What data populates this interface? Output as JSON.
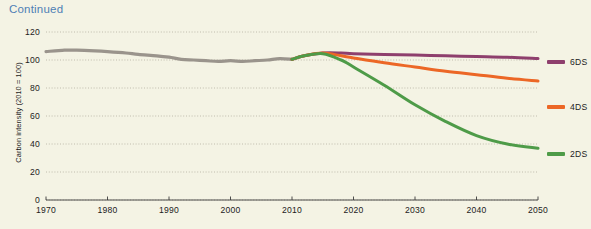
{
  "chart_title": "Continued",
  "title_color": "#4f7fb5",
  "background_color": "#f4f3e4",
  "legend": {
    "position": "right",
    "entries": [
      {
        "label": "6DS",
        "color": "#8e3f6d"
      },
      {
        "label": "4DS",
        "color": "#ec6726"
      },
      {
        "label": "2DS",
        "color": "#4e9b48"
      }
    ]
  },
  "chart_data": {
    "type": "line",
    "title": "Continued",
    "xlabel": "",
    "ylabel": "Carbon intensity (2010 = 100)",
    "xlim": [
      1970,
      2050
    ],
    "ylim": [
      0,
      120
    ],
    "xticks": [
      1970,
      1980,
      1990,
      2000,
      2010,
      2020,
      2030,
      2040,
      2050
    ],
    "yticks": [
      0,
      20,
      40,
      60,
      80,
      100,
      120
    ],
    "xtick_labels": [
      "1970",
      "1980",
      "1990",
      "2000",
      "2010",
      "2020",
      "2030",
      "2040",
      "2050"
    ],
    "ytick_labels": [
      "0",
      "20",
      "40",
      "60",
      "80",
      "100",
      "120"
    ],
    "grid": "horizontal-dotted",
    "series": [
      {
        "name": "Historical",
        "color": "#9a948c",
        "x": [
          1970,
          1973,
          1975,
          1978,
          1980,
          1983,
          1985,
          1988,
          1990,
          1992,
          1994,
          1996,
          1998,
          2000,
          2002,
          2004,
          2006,
          2008,
          2010
        ],
        "values": [
          106,
          107,
          107,
          106.5,
          106,
          105,
          104,
          103,
          102,
          100.5,
          100,
          99.5,
          99,
          99.5,
          99,
          99.5,
          100,
          101,
          100.5
        ]
      },
      {
        "name": "6DS",
        "color": "#8e3f6d",
        "x": [
          2010,
          2012,
          2015,
          2018,
          2020,
          2025,
          2030,
          2035,
          2040,
          2045,
          2050
        ],
        "values": [
          100.5,
          103,
          105,
          105,
          104.5,
          104,
          103.5,
          103,
          102.5,
          102,
          101
        ]
      },
      {
        "name": "4DS",
        "color": "#ec6726",
        "x": [
          2010,
          2012,
          2015,
          2018,
          2020,
          2025,
          2030,
          2035,
          2040,
          2045,
          2050
        ],
        "values": [
          100.5,
          103,
          105,
          103,
          101.5,
          98,
          95,
          92,
          89.5,
          87,
          85
        ]
      },
      {
        "name": "2DS",
        "color": "#4e9b48",
        "x": [
          2010,
          2012,
          2015,
          2018,
          2020,
          2025,
          2030,
          2035,
          2040,
          2045,
          2050
        ],
        "values": [
          100.5,
          103,
          104.5,
          100,
          95,
          82,
          68,
          56,
          46,
          40,
          37
        ]
      }
    ]
  }
}
